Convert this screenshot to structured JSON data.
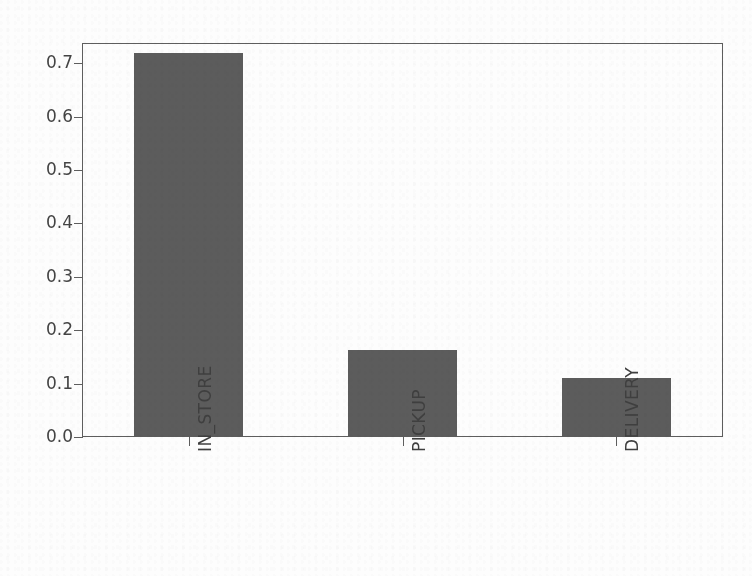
{
  "figure": {
    "background_color": "#ffffff",
    "title_remnant": "",
    "frame": {
      "left": 82,
      "top": 43,
      "width": 641,
      "height": 394,
      "color": "#5e5e5e"
    }
  },
  "chart_data": {
    "type": "bar",
    "title": "",
    "xlabel": "",
    "ylabel": "",
    "categories": [
      "IN_STORE",
      "PICKUP",
      "DELIVERY"
    ],
    "values": [
      0.719,
      0.163,
      0.11
    ],
    "ylim": [
      0.0,
      0.738
    ],
    "xlim": [
      -0.5,
      2.5
    ],
    "ytick_labels": [
      "0.0",
      "0.1",
      "0.2",
      "0.3",
      "0.4",
      "0.5",
      "0.6",
      "0.7"
    ],
    "ytick_values": [
      0.0,
      0.1,
      0.2,
      0.3,
      0.4,
      0.5,
      0.6,
      0.7
    ],
    "xtick_labels": [
      "IN_STORE",
      "PICKUP",
      "DELIVERY"
    ],
    "bar_color": "#5c5c5c",
    "bar_width_fraction": 0.51,
    "grid": false,
    "legend": false,
    "xtick_label_rotation": 90
  },
  "axis": {
    "tick_color": "#5e5e5e",
    "label_color": "#444444"
  }
}
